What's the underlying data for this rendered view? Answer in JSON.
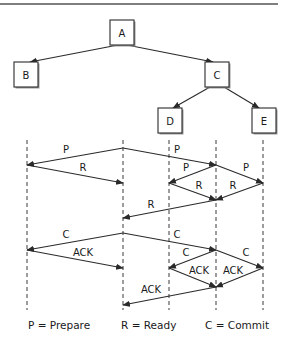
{
  "figure": {
    "colors": {
      "ink": "#2a2a2a",
      "background": "#ffffff",
      "shadow": "#9a9a9a"
    }
  },
  "tree": {
    "nodes": [
      {
        "id": "A",
        "label": "A",
        "x": 110,
        "y": 20,
        "w": 24,
        "h": 25
      },
      {
        "id": "B",
        "label": "B",
        "x": 14,
        "y": 62,
        "w": 24,
        "h": 25
      },
      {
        "id": "C",
        "label": "C",
        "x": 205,
        "y": 62,
        "w": 24,
        "h": 25
      },
      {
        "id": "D",
        "label": "D",
        "x": 158,
        "y": 108,
        "w": 24,
        "h": 25
      },
      {
        "id": "E",
        "label": "E",
        "x": 252,
        "y": 108,
        "w": 24,
        "h": 25
      }
    ],
    "edges": [
      {
        "from": "A",
        "to": "B",
        "x1": 118,
        "y1": 45,
        "x2": 30,
        "y2": 62
      },
      {
        "from": "A",
        "to": "C",
        "x1": 127,
        "y1": 45,
        "x2": 213,
        "y2": 62
      },
      {
        "from": "C",
        "to": "D",
        "x1": 210,
        "y1": 87,
        "x2": 173,
        "y2": 108
      },
      {
        "from": "C",
        "to": "E",
        "x1": 224,
        "y1": 87,
        "x2": 259,
        "y2": 108
      }
    ]
  },
  "lifelines": [
    {
      "node": "B",
      "x": 27
    },
    {
      "node": "A",
      "x": 123
    },
    {
      "node": "D",
      "x": 169
    },
    {
      "node": "C",
      "x": 216
    },
    {
      "node": "E",
      "x": 263
    }
  ],
  "lifeline_range": {
    "y1": 140,
    "y2": 310
  },
  "messages": [
    {
      "phase": "prepare",
      "label": "P",
      "from": "A",
      "to": "B",
      "x1": 123,
      "y1": 148,
      "x2": 27,
      "y2": 165,
      "lx": 66,
      "ly": 153
    },
    {
      "phase": "prepare",
      "label": "R",
      "from": "B",
      "to": "A",
      "x1": 27,
      "y1": 165,
      "x2": 123,
      "y2": 183,
      "lx": 83,
      "ly": 171
    },
    {
      "phase": "prepare",
      "label": "P",
      "from": "A",
      "to": "C",
      "x1": 123,
      "y1": 148,
      "x2": 216,
      "y2": 165,
      "lx": 177,
      "ly": 153
    },
    {
      "phase": "prepare",
      "label": "P",
      "from": "C",
      "to": "D",
      "x1": 216,
      "y1": 165,
      "x2": 169,
      "y2": 183,
      "lx": 186,
      "ly": 171
    },
    {
      "phase": "prepare",
      "label": "P",
      "from": "C",
      "to": "E",
      "x1": 216,
      "y1": 165,
      "x2": 263,
      "y2": 183,
      "lx": 246,
      "ly": 171
    },
    {
      "phase": "prepare",
      "label": "R",
      "from": "D",
      "to": "C",
      "x1": 169,
      "y1": 183,
      "x2": 216,
      "y2": 200,
      "lx": 199,
      "ly": 189
    },
    {
      "phase": "prepare",
      "label": "R",
      "from": "E",
      "to": "C",
      "x1": 263,
      "y1": 183,
      "x2": 216,
      "y2": 200,
      "lx": 233,
      "ly": 189
    },
    {
      "phase": "prepare",
      "label": "R",
      "from": "C",
      "to": "A",
      "x1": 216,
      "y1": 200,
      "x2": 123,
      "y2": 218,
      "lx": 151,
      "ly": 208
    },
    {
      "phase": "commit",
      "label": "C",
      "from": "A",
      "to": "B",
      "x1": 123,
      "y1": 233,
      "x2": 27,
      "y2": 250,
      "lx": 66,
      "ly": 238
    },
    {
      "phase": "commit",
      "label": "ACK",
      "from": "B",
      "to": "A",
      "x1": 27,
      "y1": 250,
      "x2": 123,
      "y2": 268,
      "lx": 83,
      "ly": 256
    },
    {
      "phase": "commit",
      "label": "C",
      "from": "A",
      "to": "C",
      "x1": 123,
      "y1": 233,
      "x2": 216,
      "y2": 250,
      "lx": 177,
      "ly": 238
    },
    {
      "phase": "commit",
      "label": "C",
      "from": "C",
      "to": "D",
      "x1": 216,
      "y1": 250,
      "x2": 169,
      "y2": 268,
      "lx": 186,
      "ly": 256
    },
    {
      "phase": "commit",
      "label": "C",
      "from": "C",
      "to": "E",
      "x1": 216,
      "y1": 250,
      "x2": 263,
      "y2": 268,
      "lx": 246,
      "ly": 256
    },
    {
      "phase": "commit",
      "label": "ACK",
      "from": "D",
      "to": "C",
      "x1": 169,
      "y1": 268,
      "x2": 216,
      "y2": 287,
      "lx": 199,
      "ly": 274
    },
    {
      "phase": "commit",
      "label": "ACK",
      "from": "E",
      "to": "C",
      "x1": 263,
      "y1": 268,
      "x2": 216,
      "y2": 287,
      "lx": 233,
      "ly": 274
    },
    {
      "phase": "commit",
      "label": "ACK",
      "from": "C",
      "to": "A",
      "x1": 216,
      "y1": 287,
      "x2": 123,
      "y2": 305,
      "lx": 151,
      "ly": 293
    }
  ],
  "legend": [
    {
      "text": "P = Prepare",
      "x": 28,
      "y": 329
    },
    {
      "text": "R = Ready",
      "x": 121,
      "y": 329
    },
    {
      "text": "C = Commit",
      "x": 205,
      "y": 329
    }
  ]
}
